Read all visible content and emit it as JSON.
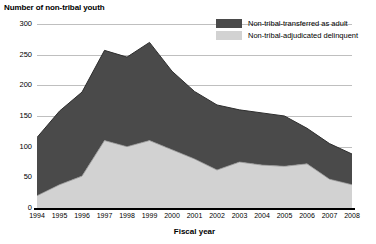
{
  "chart_data": {
    "type": "area",
    "title": "",
    "ylabel": "Number of non-tribal youth",
    "xlabel": "Fiscal year",
    "ylim": [
      0,
      300
    ],
    "yticks": [
      0,
      50,
      100,
      150,
      200,
      250,
      300
    ],
    "grid": true,
    "stacked": true,
    "legend_position": "top-right",
    "categories": [
      "1994",
      "1995",
      "1996",
      "1997",
      "1998",
      "1999",
      "2000",
      "2001",
      "2002",
      "2003",
      "2004",
      "2005",
      "2006",
      "2007",
      "2008"
    ],
    "series": [
      {
        "name": "Non-tribal-adjudicated delinquent",
        "color": "#d2d2d2",
        "values": [
          20,
          38,
          52,
          110,
          100,
          110,
          95,
          80,
          62,
          75,
          70,
          68,
          72,
          47,
          38
        ]
      },
      {
        "name": "Non-tribal-transferred as adult",
        "color": "#4a4a4a",
        "values": [
          95,
          120,
          137,
          147,
          146,
          160,
          128,
          110,
          106,
          85,
          85,
          82,
          58,
          58,
          50
        ]
      }
    ],
    "totals": [
      115,
      158,
      189,
      257,
      246,
      270,
      223,
      190,
      168,
      160,
      155,
      150,
      130,
      105,
      88
    ]
  },
  "axis": {
    "y_title": "Number of non-tribal youth",
    "x_title": "Fiscal year",
    "y_labels": [
      "300",
      "250",
      "200",
      "150",
      "100",
      "50",
      "0"
    ],
    "x_labels": [
      "1994",
      "1995",
      "1996",
      "1997",
      "1998",
      "1999",
      "2000",
      "2001",
      "2002",
      "2003",
      "2004",
      "2005",
      "2006",
      "2007",
      "2008"
    ]
  },
  "legend": {
    "items": [
      {
        "label": "Non-tribal-transferred as adult",
        "color": "#4a4a4a"
      },
      {
        "label": "Non-tribal-adjudicated delinquent",
        "color": "#d2d2d2"
      }
    ]
  },
  "colors": {
    "dark_series": "#4a4a4a",
    "light_series": "#d2d2d2",
    "gridline": "#bfbfbf",
    "axis": "#000000",
    "background": "#ffffff"
  }
}
